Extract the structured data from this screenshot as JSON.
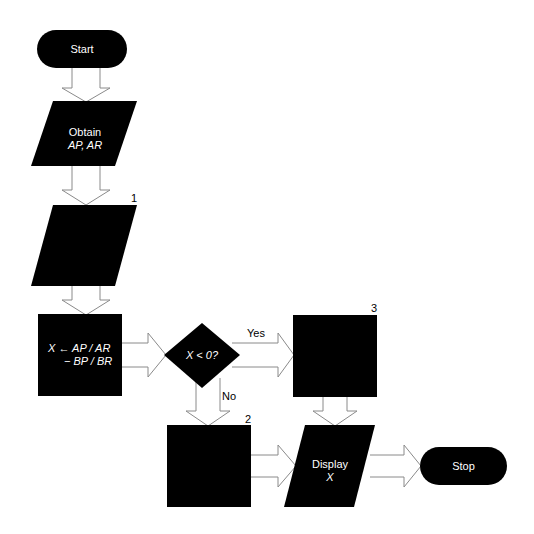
{
  "diagram": {
    "type": "flowchart",
    "nodes": {
      "start": {
        "shape": "terminal",
        "label": "Start"
      },
      "obtain": {
        "shape": "input-output",
        "label_line1": "Obtain",
        "label_line2": "AP, AR"
      },
      "io1": {
        "shape": "input-output",
        "label": "",
        "number": "1"
      },
      "compute": {
        "shape": "process",
        "label_line1": "X ← AP / AR",
        "label_line2": "− BP / BR"
      },
      "decision": {
        "shape": "decision",
        "label": "X < 0?"
      },
      "box3": {
        "shape": "process",
        "label": "",
        "number": "3"
      },
      "box2": {
        "shape": "process",
        "label": "",
        "number": "2"
      },
      "display": {
        "shape": "input-output",
        "label_line1": "Display",
        "label_line2": "X"
      },
      "stop": {
        "shape": "terminal",
        "label": "Stop"
      }
    },
    "edges": {
      "yes": "Yes",
      "no": "No"
    },
    "colors": {
      "shape_fill": "#000000",
      "shape_text": "#ffffff",
      "arrow_stroke": "#888888",
      "background": "#ffffff"
    }
  }
}
